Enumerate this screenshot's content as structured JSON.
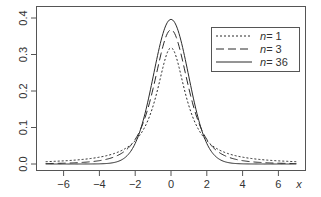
{
  "chart_data": {
    "type": "line",
    "title": "",
    "xlabel": "x",
    "ylabel": "",
    "xlim": [
      -7,
      7
    ],
    "ylim": [
      0,
      0.4
    ],
    "x_ticks": [
      -6,
      -4,
      -2,
      0,
      2,
      4,
      6
    ],
    "x_tick_labels": [
      "−6",
      "−4",
      "−2",
      "0",
      "2",
      "4",
      "6"
    ],
    "y_ticks": [
      0.0,
      0.1,
      0.2,
      0.3,
      0.4
    ],
    "y_tick_labels": [
      "0.0",
      "0.1",
      "0.2",
      "0.3",
      "0.4"
    ],
    "grid": false,
    "legend_position": "top-right",
    "series": [
      {
        "name": "n = 1",
        "label_n": "n",
        "label_value": "= 1",
        "dash": "2,2",
        "df": 1,
        "peak": 0.318,
        "x": [
          -7,
          -6,
          -5,
          -4,
          -3,
          -2,
          -1.5,
          -1,
          -0.5,
          0,
          0.5,
          1,
          1.5,
          2,
          3,
          4,
          5,
          6,
          7
        ],
        "values": [
          0.0064,
          0.0086,
          0.0122,
          0.0187,
          0.0318,
          0.0637,
          0.0979,
          0.1592,
          0.2546,
          0.3183,
          0.2546,
          0.1592,
          0.0979,
          0.0637,
          0.0318,
          0.0187,
          0.0122,
          0.0086,
          0.0064
        ]
      },
      {
        "name": "n = 3",
        "label_n": "n",
        "label_value": "= 3",
        "dash": "8,4",
        "df": 3,
        "peak": 0.368,
        "x": [
          -7,
          -6,
          -5,
          -4,
          -3,
          -2,
          -1.5,
          -1,
          -0.5,
          0,
          0.5,
          1,
          1.5,
          2,
          3,
          4,
          5,
          6,
          7
        ],
        "values": [
          0.0018,
          0.0028,
          0.0042,
          0.0092,
          0.023,
          0.0675,
          0.1245,
          0.2067,
          0.3104,
          0.3676,
          0.3104,
          0.2067,
          0.1245,
          0.0675,
          0.023,
          0.0092,
          0.0042,
          0.0028,
          0.0018
        ]
      },
      {
        "name": "n = 36",
        "label_n": "n",
        "label_value": "= 36",
        "dash": "",
        "df": 36,
        "peak": 0.396,
        "x": [
          -7,
          -6,
          -5,
          -4,
          -3,
          -2,
          -1.5,
          -1,
          -0.5,
          0,
          0.5,
          1,
          1.5,
          2,
          3,
          4,
          5,
          6,
          7
        ],
        "values": [
          0.0,
          0.0,
          0.0,
          0.0003,
          0.006,
          0.0572,
          0.1292,
          0.2406,
          0.35,
          0.396,
          0.35,
          0.2406,
          0.1292,
          0.0572,
          0.006,
          0.0003,
          0.0,
          0.0,
          0.0
        ]
      }
    ]
  },
  "legend": {
    "items": [
      {
        "n": "n",
        "value": "= 1"
      },
      {
        "n": "n",
        "value": "= 3"
      },
      {
        "n": "n",
        "value": "= 36"
      }
    ]
  },
  "axis": {
    "x_label": "x"
  },
  "colors": {
    "line": "#2a2a2a",
    "frame": "#555555",
    "text": "#333333"
  }
}
